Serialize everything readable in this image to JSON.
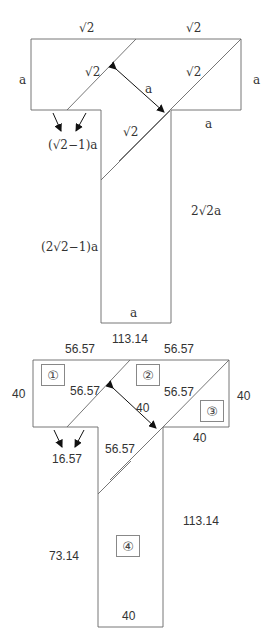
{
  "top_diagram": {
    "labels": {
      "top_left_sqrt2": "√2",
      "top_right_sqrt2": "√2",
      "left_a": "a",
      "diag1_sqrt2": "√2",
      "diag2_sqrt2": "√2",
      "right_a": "a",
      "arrow_a": "a",
      "step_a": "a",
      "lower_diag_sqrt2": "√2",
      "gap_expr": "(√2−1)a",
      "right_height": "2√2a",
      "left_height": "(2√2−1)a",
      "bottom_a": "a"
    }
  },
  "bottom_diagram": {
    "labels": {
      "total_width": "113.14",
      "top_left": "56.57",
      "top_right": "56.57",
      "left_height": "40",
      "diag1": "56.57",
      "diag2": "56.57",
      "arrow_value": "40",
      "right_height": "40",
      "step_width": "40",
      "lower_diag": "56.57",
      "gap": "16.57",
      "stem_right": "113.14",
      "stem_left": "73.14",
      "bottom_width": "40"
    },
    "pieces": [
      "①",
      "②",
      "③",
      "④"
    ]
  },
  "colors": {
    "line": "#555555",
    "arrow": "#111111",
    "text": "#333333"
  }
}
